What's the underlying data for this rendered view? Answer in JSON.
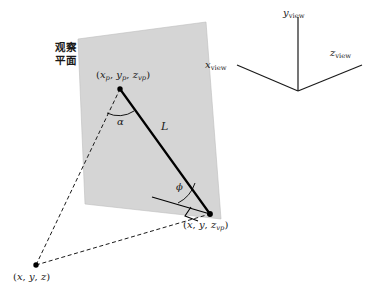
{
  "figure": {
    "type": "3d-projection-diagram",
    "plane_label_line1": "观察",
    "plane_label_line2": "平面",
    "plane_fill": "#d5d5d5",
    "line_color": "#000000",
    "background": "#ffffff"
  },
  "axes": {
    "x": {
      "name": "x",
      "subscript": "view"
    },
    "y": {
      "name": "y",
      "subscript": "view"
    },
    "z": {
      "name": "z",
      "subscript": "view"
    }
  },
  "points": {
    "projected": {
      "x": "x",
      "x_sub": "p",
      "y": "y",
      "y_sub": "p",
      "z": "z",
      "z_sub": "vp",
      "open": "(",
      "close": ")",
      "sep": ", "
    },
    "on_plane": {
      "x": "x",
      "y": "y",
      "z": "z",
      "z_sub": "vp",
      "open": "(",
      "close": ")",
      "sep": ", "
    },
    "world": {
      "x": "x",
      "y": "y",
      "z": "z",
      "open": "(",
      "close": ")",
      "sep": ", "
    }
  },
  "annotations": {
    "length": "L",
    "alpha": "α",
    "phi": "ϕ"
  }
}
